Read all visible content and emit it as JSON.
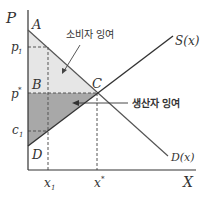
{
  "diagram": {
    "title": "",
    "axes": {
      "y_label": "P",
      "x_label": "X"
    },
    "points": {
      "A": "A",
      "B": "B",
      "C": "C",
      "D": "D"
    },
    "price_ticks": {
      "p1": "p",
      "p1_sub": "1",
      "pstar": "p",
      "pstar_sup": "*",
      "c1": "c",
      "c1_sub": "1"
    },
    "quantity_ticks": {
      "x1": "x",
      "x1_sub": "1",
      "xstar": "x",
      "xstar_sup": "*"
    },
    "curves": {
      "supply": "S(x)",
      "demand": "D(x)"
    },
    "annotations": {
      "consumer_surplus": "소비자 잉여",
      "producer_surplus": "생산자 잉여"
    },
    "colors": {
      "consumer_surplus_fill": "#e6e6e6",
      "producer_surplus_fill": "#a8a8a8",
      "line": "#333333",
      "dashed": "#555555"
    }
  }
}
